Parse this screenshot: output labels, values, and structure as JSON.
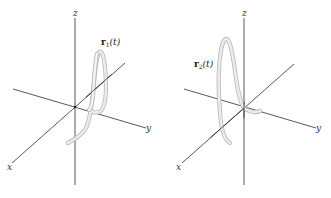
{
  "figure": {
    "panels": [
      {
        "id": "left",
        "axes": {
          "z_label": "z",
          "y_label": "y",
          "x_label": "x"
        },
        "curve_label": {
          "name": "r",
          "subscript": "1",
          "arg": "(t)"
        }
      },
      {
        "id": "right",
        "axes": {
          "z_label": "z",
          "y_label": "y",
          "x_label": "x"
        },
        "curve_label": {
          "name": "r",
          "subscript": "2",
          "arg": "(t)"
        }
      }
    ],
    "colors": {
      "axis": "#2e2e2e",
      "tube_edge": "#b9b9b9",
      "tube_fill": "#f4f4f4",
      "background": "#ffffff"
    }
  }
}
